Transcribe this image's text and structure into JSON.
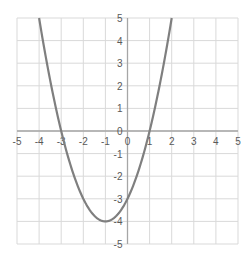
{
  "chart_data": {
    "type": "line",
    "title": "",
    "xlabel": "",
    "ylabel": "",
    "xlim": [
      -5,
      5
    ],
    "ylim": [
      -5,
      5
    ],
    "grid": true,
    "legend": null,
    "x_ticks": [
      -5,
      -4,
      -3,
      -2,
      -1,
      0,
      1,
      2,
      3,
      4,
      5
    ],
    "y_ticks": [
      5,
      4,
      3,
      2,
      1,
      0,
      -1,
      -2,
      -3,
      -4,
      -5
    ],
    "series": [
      {
        "name": "y = x^2 + 2x - 3",
        "color": "#7f7f7f",
        "x": [
          -4,
          -3.5,
          -3,
          -2.5,
          -2,
          -1.5,
          -1,
          -0.5,
          0,
          0.5,
          1,
          1.5,
          2
        ],
        "y": [
          5,
          2.25,
          0,
          -1.75,
          -3,
          -3.75,
          -4,
          -3.75,
          -3,
          -1.75,
          0,
          2.25,
          5
        ]
      }
    ]
  },
  "colors": {
    "grid": "#d9d9d9",
    "axis": "#a6a6a6",
    "curve": "#7f7f7f",
    "tick_text": "#595959"
  }
}
